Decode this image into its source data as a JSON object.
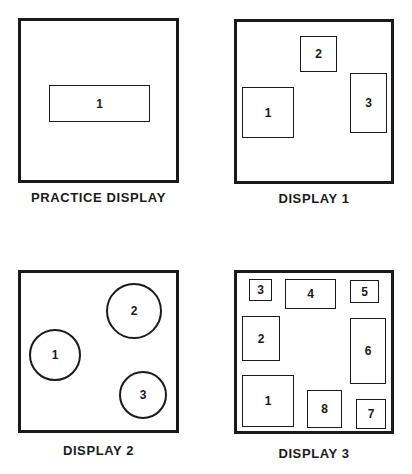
{
  "panels": [
    {
      "caption": "PRACTICE DISPLAY",
      "frame": {
        "x": 18,
        "y": 18,
        "w": 161,
        "h": 165
      },
      "caption_pos": {
        "x": 18,
        "y": 190,
        "w": 161
      },
      "shape": "rect",
      "items": [
        {
          "label": "1",
          "x": 49,
          "y": 85,
          "w": 101,
          "h": 37
        }
      ]
    },
    {
      "caption": "DISPLAY 1",
      "frame": {
        "x": 234,
        "y": 19,
        "w": 160,
        "h": 165
      },
      "caption_pos": {
        "x": 234,
        "y": 191,
        "w": 160
      },
      "shape": "rect",
      "items": [
        {
          "label": "1",
          "x": 242,
          "y": 87,
          "w": 52,
          "h": 51
        },
        {
          "label": "2",
          "x": 300,
          "y": 36,
          "w": 37,
          "h": 36
        },
        {
          "label": "3",
          "x": 350,
          "y": 73,
          "w": 37,
          "h": 60
        }
      ]
    },
    {
      "caption": "DISPLAY 2",
      "frame": {
        "x": 18,
        "y": 270,
        "w": 161,
        "h": 163
      },
      "caption_pos": {
        "x": 18,
        "y": 443,
        "w": 161
      },
      "shape": "circle",
      "items": [
        {
          "label": "1",
          "x": 29,
          "y": 329,
          "w": 52,
          "h": 52
        },
        {
          "label": "2",
          "x": 106,
          "y": 283,
          "w": 56,
          "h": 56
        },
        {
          "label": "3",
          "x": 119,
          "y": 371,
          "w": 48,
          "h": 48
        }
      ]
    },
    {
      "caption": "DISPLAY 3",
      "frame": {
        "x": 234,
        "y": 270,
        "w": 160,
        "h": 164
      },
      "caption_pos": {
        "x": 234,
        "y": 446,
        "w": 160
      },
      "shape": "rect",
      "items": [
        {
          "label": "1",
          "x": 242,
          "y": 375,
          "w": 52,
          "h": 52
        },
        {
          "label": "2",
          "x": 242,
          "y": 316,
          "w": 38,
          "h": 45
        },
        {
          "label": "3",
          "x": 249,
          "y": 279,
          "w": 23,
          "h": 22
        },
        {
          "label": "4",
          "x": 285,
          "y": 279,
          "w": 51,
          "h": 30
        },
        {
          "label": "5",
          "x": 350,
          "y": 280,
          "w": 29,
          "h": 23
        },
        {
          "label": "6",
          "x": 350,
          "y": 318,
          "w": 36,
          "h": 66
        },
        {
          "label": "7",
          "x": 356,
          "y": 399,
          "w": 30,
          "h": 30
        },
        {
          "label": "8",
          "x": 307,
          "y": 390,
          "w": 35,
          "h": 38
        }
      ]
    }
  ]
}
